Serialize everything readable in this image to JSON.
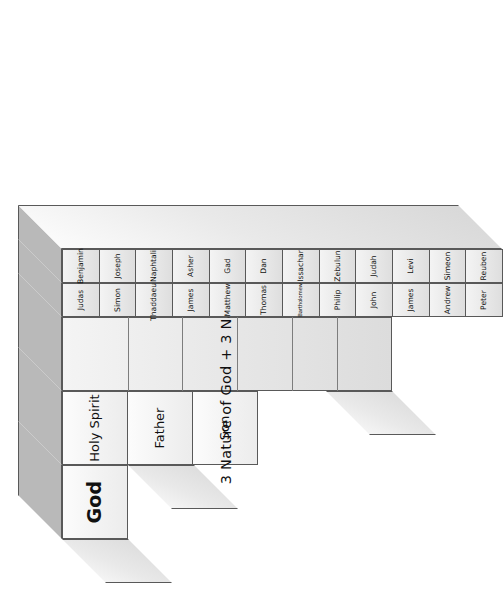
{
  "diagram": {
    "title": "3 Nature of God + 3 Nature of Man",
    "orientation": "rotated-90-ccw",
    "accent_top_face": "#b9b9b9",
    "accent_outline": "#595959",
    "levels": [
      {
        "marker": "*",
        "name": "God"
      },
      {
        "marker": "**",
        "name": "Trinity"
      },
      {
        "marker": "***",
        "name": "Nature"
      },
      {
        "marker": "****",
        "name": "Apostles"
      },
      {
        "marker": "*****",
        "name": "Tribes"
      }
    ],
    "level1": {
      "label": "God"
    },
    "level2": {
      "labels": [
        "Son",
        "Father",
        "Holy Spirit"
      ]
    },
    "level3": {
      "label": "3 Nature of God + 3 Nature of Man"
    },
    "level4": {
      "name": "apostles",
      "labels": [
        "Peter",
        "Andrew",
        "James",
        "John",
        "Philip",
        "Bartholomew",
        "Thomas",
        "Matthew",
        "James",
        "Thaddaeus",
        "Simon",
        "Judas"
      ]
    },
    "level5": {
      "name": "tribes",
      "labels": [
        "Reuben",
        "Simeon",
        "Levi",
        "Judah",
        "Zebulun",
        "Issachar",
        "Dan",
        "Gad",
        "Asher",
        "Naphtali",
        "Joseph",
        "Benjamin"
      ]
    },
    "markers": {
      "one": "*",
      "two": "**",
      "three": "***",
      "four": "****",
      "five": "*****"
    }
  }
}
